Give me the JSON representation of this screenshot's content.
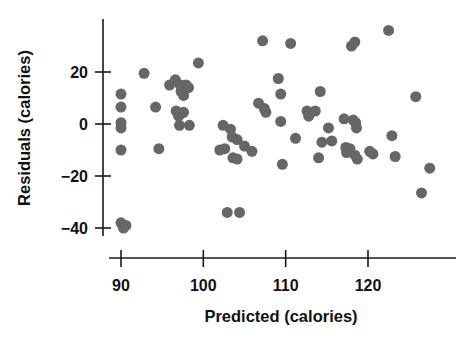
{
  "figure": {
    "type": "scatter-plot",
    "background_color": "#ffffff",
    "dot_color": "#666666",
    "axis_color": "#1a1a1a",
    "text_color": "#111111"
  },
  "chart_data": {
    "type": "scatter",
    "title": "",
    "xlabel": "Predicted (calories)",
    "ylabel": "Residuals (calories)",
    "xticks": [
      90,
      100,
      110,
      120
    ],
    "xtick_labels": [
      "90",
      "100",
      "110",
      "120"
    ],
    "yticks": [
      20,
      0,
      -20,
      -40
    ],
    "ytick_labels": [
      "20",
      "0",
      "-20",
      "-40"
    ],
    "xlim": [
      87.4,
      129.5
    ],
    "ylim": [
      -44,
      40
    ],
    "grid": false,
    "legend": null,
    "marker_size_px": 11,
    "points": [
      [
        90.0,
        11.5
      ],
      [
        90.0,
        6.5
      ],
      [
        90.0,
        0.5
      ],
      [
        90.0,
        -1.5
      ],
      [
        90.0,
        -10.0
      ],
      [
        90.0,
        -38.0
      ],
      [
        90.3,
        -40.0
      ],
      [
        90.6,
        -39.0
      ],
      [
        92.8,
        19.5
      ],
      [
        94.2,
        6.5
      ],
      [
        94.6,
        -9.5
      ],
      [
        95.9,
        15.0
      ],
      [
        96.6,
        17.0
      ],
      [
        97.2,
        15.0
      ],
      [
        97.3,
        12.5
      ],
      [
        97.5,
        13.5
      ],
      [
        97.6,
        11.0
      ],
      [
        97.9,
        15.0
      ],
      [
        98.2,
        14.0
      ],
      [
        96.7,
        5.0
      ],
      [
        97.0,
        3.0
      ],
      [
        97.3,
        4.0
      ],
      [
        97.6,
        4.5
      ],
      [
        97.1,
        -0.5
      ],
      [
        98.3,
        -0.5
      ],
      [
        99.4,
        23.5
      ],
      [
        102.4,
        -0.5
      ],
      [
        102.0,
        -10.0
      ],
      [
        102.6,
        -9.5
      ],
      [
        102.9,
        -34.0
      ],
      [
        103.3,
        -2.0
      ],
      [
        103.5,
        -5.0
      ],
      [
        103.6,
        -13.0
      ],
      [
        104.1,
        -13.5
      ],
      [
        104.1,
        -6.0
      ],
      [
        104.4,
        -34.0
      ],
      [
        105.0,
        -8.5
      ],
      [
        105.9,
        -10.5
      ],
      [
        106.7,
        8.0
      ],
      [
        107.2,
        32.0
      ],
      [
        107.4,
        6.0
      ],
      [
        107.6,
        4.5
      ],
      [
        109.1,
        17.5
      ],
      [
        109.4,
        11.5
      ],
      [
        109.4,
        1.0
      ],
      [
        109.6,
        -15.5
      ],
      [
        110.6,
        31.0
      ],
      [
        111.2,
        -5.5
      ],
      [
        112.6,
        5.0
      ],
      [
        112.8,
        3.0
      ],
      [
        113.6,
        5.0
      ],
      [
        114.2,
        12.5
      ],
      [
        114.0,
        -13.0
      ],
      [
        114.4,
        -7.0
      ],
      [
        115.2,
        -1.5
      ],
      [
        115.6,
        -6.5
      ],
      [
        117.1,
        2.0
      ],
      [
        117.3,
        -9.0
      ],
      [
        117.4,
        -11.0
      ],
      [
        117.8,
        -9.5
      ],
      [
        118.0,
        30.0
      ],
      [
        118.4,
        31.5
      ],
      [
        118.2,
        1.5
      ],
      [
        118.5,
        0.5
      ],
      [
        118.6,
        -1.5
      ],
      [
        118.4,
        -12.0
      ],
      [
        118.7,
        -13.5
      ],
      [
        120.2,
        -10.5
      ],
      [
        120.6,
        -11.5
      ],
      [
        122.5,
        36.0
      ],
      [
        122.9,
        -4.5
      ],
      [
        123.3,
        -12.5
      ],
      [
        125.8,
        10.5
      ],
      [
        126.5,
        -26.5
      ],
      [
        127.5,
        -17.0
      ]
    ]
  }
}
